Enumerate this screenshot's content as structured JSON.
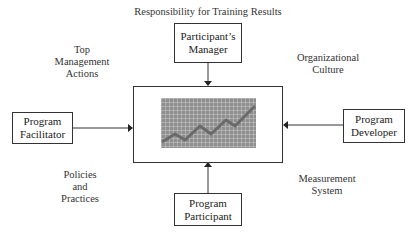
{
  "title": "Responsibility for Training Results",
  "nodes": {
    "top": "Participant’s Manager",
    "left": "Program Facilitator",
    "right": "Program Developer",
    "bottom": "Program Participant",
    "center": "Training results chart"
  },
  "node_lines": {
    "top": [
      "Participant’s",
      "Manager"
    ],
    "left": [
      "Program",
      "Facilitator"
    ],
    "right": [
      "Program",
      "Developer"
    ],
    "bottom": [
      "Program",
      "Participant"
    ]
  },
  "factors": {
    "top_left": [
      "Top",
      "Management",
      "Actions"
    ],
    "top_right": [
      "Organizational",
      "Culture"
    ],
    "bottom_left": [
      "Policies",
      "and",
      "Practices"
    ],
    "bottom_right": [
      "Measurement",
      "System"
    ]
  },
  "colors": {
    "line": "#333333",
    "chart_fill": "#8f8f8f",
    "chart_trend": "#6a6a6a"
  }
}
